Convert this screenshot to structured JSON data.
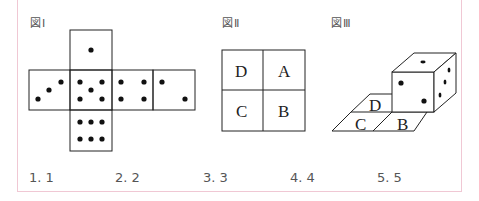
{
  "figures": {
    "fig1": {
      "label": "図Ⅰ",
      "net_faces": {
        "top": 1,
        "left": 3,
        "center": 5,
        "right1": 4,
        "right2": 2,
        "bottom": 6
      }
    },
    "fig2": {
      "label": "図Ⅱ",
      "grid": [
        [
          "D",
          "A"
        ],
        [
          "C",
          "B"
        ]
      ]
    },
    "fig3": {
      "label": "図Ⅲ",
      "floor_labels": [
        "D",
        "C",
        "B"
      ],
      "die_visible_faces": {
        "top": 1,
        "front": 2,
        "right": 3
      }
    }
  },
  "choices": [
    {
      "label": "1.  1"
    },
    {
      "label": "2.  2"
    },
    {
      "label": "3.  3"
    },
    {
      "label": "4.  4"
    },
    {
      "label": "5.  5"
    }
  ],
  "colors": {
    "frame_border": "#f0c8d4",
    "line": "#222222"
  }
}
